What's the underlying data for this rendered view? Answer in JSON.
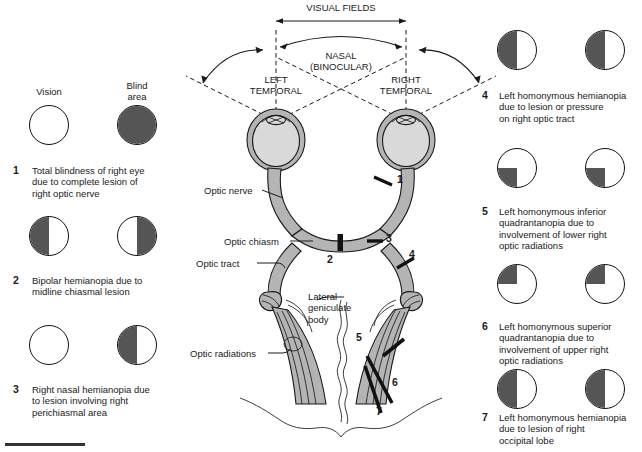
{
  "figure": {
    "title_caps": {
      "visual_fields": "VISUAL FIELDS",
      "nasal": "NASAL\n(BINOCULAR)",
      "left_temporal": "LEFT\nTEMPORAL",
      "right_temporal": "RIGHT\nTEMPORAL"
    },
    "anatomy_labels": {
      "optic_nerve": "Optic nerve",
      "optic_chiasm": "Optic chiasm",
      "optic_tract": "Optic tract",
      "lateral_geniculate_body": "Lateral\ngeniculate\nbody",
      "optic_radiations": "Optic radiations"
    },
    "lesion_markers": [
      "1",
      "2",
      "3",
      "4",
      "5",
      "6",
      "7"
    ],
    "key": {
      "vision_label": "Vision",
      "blind_label": "Blind\narea"
    },
    "colors": {
      "blind_fill": "#555555",
      "tissue_fill": "#b4b4b4",
      "globe_fill": "#d9d9d9",
      "outline": "#1a1a1a"
    }
  },
  "defects": [
    {
      "number": "1",
      "text": "Total blindness of right eye\ndue to complete lesion of\nright optic nerve",
      "left_eye": "none",
      "right_eye": "full"
    },
    {
      "number": "2",
      "text": "Bipolar hemianopia due to\nmidline chiasmal lesion",
      "left_eye": "left-half",
      "right_eye": "right-half"
    },
    {
      "number": "3",
      "text": "Right nasal hemianopia due\nto lesion involving right\nperichiasmal area",
      "left_eye": "none",
      "right_eye": "left-half"
    },
    {
      "number": "4",
      "text": "Left homonymous hemianopia\ndue to lesion or pressure\non right optic tract",
      "left_eye": "left-half",
      "right_eye": "left-half"
    },
    {
      "number": "5",
      "text": "Left homonymous inferior\nquadrantanopia due to\ninvolvement of lower right\noptic radiations",
      "left_eye": "lower-left-quadrant",
      "right_eye": "lower-left-quadrant"
    },
    {
      "number": "6",
      "text": "Left homonymous superior\nquadrantanopia due to\ninvolvement of upper right\noptic radiations",
      "left_eye": "upper-left-quadrant",
      "right_eye": "upper-left-quadrant"
    },
    {
      "number": "7",
      "text": "Left homonymous hemianopia\ndue to lesion of right\noccipital lobe",
      "left_eye": "left-half",
      "right_eye": "left-half"
    }
  ]
}
